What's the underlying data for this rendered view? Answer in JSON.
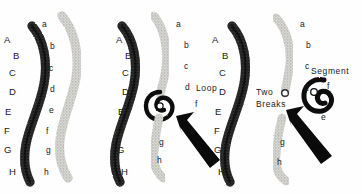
{
  "figure": {
    "background_color": "#fefefe",
    "ink_color": "#1a1a1a",
    "width": 362,
    "height": 194
  },
  "panels": [
    {
      "id": "panel-1",
      "name": "intact-chromosome-pair",
      "caption": "",
      "dark_chromatid": {
        "name": "dark-chromatid",
        "shade": "dark",
        "labels": [
          {
            "text": "A",
            "x": 4,
            "y": 40
          },
          {
            "text": "B",
            "x": 13,
            "y": 56
          },
          {
            "text": "C",
            "x": 9,
            "y": 73
          },
          {
            "text": "D",
            "x": 9,
            "y": 92
          },
          {
            "text": "E",
            "x": 5,
            "y": 112
          },
          {
            "text": "F",
            "x": 4,
            "y": 131
          },
          {
            "text": "G",
            "x": 4,
            "y": 150
          },
          {
            "text": "H",
            "x": 9,
            "y": 172
          }
        ]
      },
      "light_chromatid": {
        "name": "light-chromatid",
        "shade": "light",
        "labels": [
          {
            "text": "a",
            "x": 42,
            "y": 24
          },
          {
            "text": "b",
            "x": 50,
            "y": 46
          },
          {
            "text": "c",
            "x": 49,
            "y": 68
          },
          {
            "text": "d",
            "x": 50,
            "y": 89
          },
          {
            "text": "e",
            "x": 49,
            "y": 110
          },
          {
            "text": "f",
            "x": 46,
            "y": 131
          },
          {
            "text": "g",
            "x": 46,
            "y": 150
          },
          {
            "text": "h",
            "x": 44,
            "y": 172
          }
        ]
      }
    },
    {
      "id": "panel-2",
      "name": "loop-formation",
      "caption": "Loop",
      "caption_pos": {
        "x": 196,
        "y": 89
      },
      "dark_chromatid": {
        "name": "dark-chromatid",
        "shade": "dark",
        "labels": [
          {
            "text": "A",
            "x": 116,
            "y": 40
          },
          {
            "text": "B",
            "x": 125,
            "y": 56
          },
          {
            "text": "C",
            "x": 122,
            "y": 73
          },
          {
            "text": "D",
            "x": 122,
            "y": 92
          },
          {
            "text": "E",
            "x": 118,
            "y": 112
          },
          {
            "text": "F",
            "x": 117,
            "y": 131
          },
          {
            "text": "G",
            "x": 117,
            "y": 150
          },
          {
            "text": "H",
            "x": 121,
            "y": 172
          }
        ]
      },
      "light_chromatid": {
        "name": "light-chromatid-with-loop",
        "shade": "light",
        "labels": [
          {
            "text": "a",
            "x": 176,
            "y": 24
          },
          {
            "text": "b",
            "x": 184,
            "y": 45
          },
          {
            "text": "c",
            "x": 184,
            "y": 66
          },
          {
            "text": "d",
            "x": 185,
            "y": 87
          },
          {
            "text": "f",
            "x": 195,
            "y": 104
          },
          {
            "text": "e",
            "x": 190,
            "y": 131
          },
          {
            "text": "g",
            "x": 159,
            "y": 142
          },
          {
            "text": "h",
            "x": 157,
            "y": 160
          }
        ]
      },
      "arrow": {
        "name": "pointer-arrow",
        "x": 185,
        "y": 110
      }
    },
    {
      "id": "panel-3",
      "name": "two-breaks-and-segment",
      "caption": "Two Breaks",
      "caption_lines": [
        "Two",
        "Breaks"
      ],
      "caption_pos": {
        "x": 258,
        "y": 92
      },
      "segment_caption": "Segment",
      "segment_caption_pos": {
        "x": 311,
        "y": 73
      },
      "dark_chromatid": {
        "name": "dark-chromatid",
        "shade": "dark",
        "labels": [
          {
            "text": "A",
            "x": 212,
            "y": 40
          },
          {
            "text": "B",
            "x": 222,
            "y": 56
          },
          {
            "text": "C",
            "x": 219,
            "y": 73
          },
          {
            "text": "D",
            "x": 219,
            "y": 92
          },
          {
            "text": "E",
            "x": 215,
            "y": 112
          },
          {
            "text": "F",
            "x": 214,
            "y": 131
          },
          {
            "text": "G",
            "x": 214,
            "y": 150
          },
          {
            "text": "H",
            "x": 218,
            "y": 172
          }
        ]
      },
      "light_chromatid": {
        "name": "light-chromatid-broken",
        "shade": "light",
        "labels": [
          {
            "text": "a",
            "x": 300,
            "y": 24
          },
          {
            "text": "b",
            "x": 306,
            "y": 45
          },
          {
            "text": "c",
            "x": 305,
            "y": 66
          },
          {
            "text": "d",
            "x": 304,
            "y": 88
          },
          {
            "text": "f",
            "x": 327,
            "y": 86
          },
          {
            "text": "e",
            "x": 321,
            "y": 117
          },
          {
            "text": "g",
            "x": 280,
            "y": 142
          },
          {
            "text": "h",
            "x": 277,
            "y": 162
          }
        ]
      },
      "arrow": {
        "name": "pointer-arrow",
        "x": 288,
        "y": 110
      }
    }
  ],
  "legend": {
    "uppercase_sequence": [
      "A",
      "B",
      "C",
      "D",
      "E",
      "F",
      "G",
      "H"
    ],
    "lowercase_sequence": [
      "a",
      "b",
      "c",
      "d",
      "e",
      "f",
      "g",
      "h"
    ]
  }
}
